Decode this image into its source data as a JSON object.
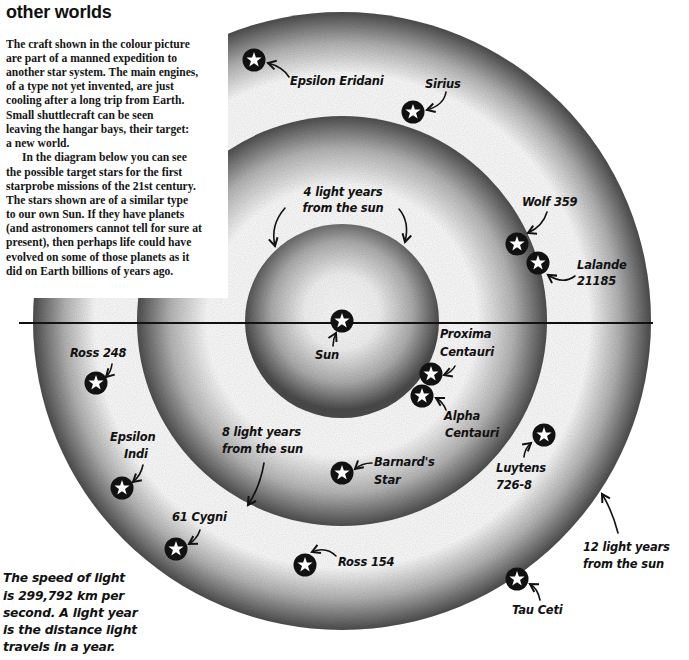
{
  "article": {
    "title": "other worlds",
    "intro_lines": [
      "The craft shown in the colour picture",
      "are part of a manned expedition to",
      "another star system. The main engines,",
      "of a type not yet invented, are just",
      "cooling after a long trip from Earth.",
      "Small shuttlecraft can be seen",
      "leaving the hangar bays, their target:",
      "a new world.",
      "In the diagram below you can see",
      "the possible target stars for the first",
      "starprobe missions of the 21st century.",
      "The stars shown are of a similar type",
      "to our own Sun. If they have planets",
      "(and astronomers cannot tell for sure at",
      "present), then perhaps life could have",
      "evolved on some of those planets as it",
      "did on Earth billions of years ago."
    ],
    "footnote_lines": [
      "The speed of light",
      "is 299,792 km per",
      "second. A light year",
      "is the distance light",
      "travels in a year."
    ]
  },
  "diagram": {
    "rings": [
      {
        "label_lines": [
          "4 light years",
          "from the sun"
        ]
      },
      {
        "label_lines": [
          "8 light years",
          "from the sun"
        ]
      },
      {
        "label_lines": [
          "12 light years",
          "from the sun"
        ]
      }
    ],
    "stars": [
      {
        "name_lines": [
          "Sun"
        ]
      },
      {
        "name_lines": [
          "Proxima",
          "Centauri"
        ]
      },
      {
        "name_lines": [
          "Alpha",
          "Centauri"
        ]
      },
      {
        "name_lines": [
          "Barnard's",
          "Star"
        ]
      },
      {
        "name_lines": [
          "Wolf 359"
        ]
      },
      {
        "name_lines": [
          "Lalande",
          "21185"
        ]
      },
      {
        "name_lines": [
          "Sirius"
        ]
      },
      {
        "name_lines": [
          "Epsilon Eridani"
        ]
      },
      {
        "name_lines": [
          "Ross 248"
        ]
      },
      {
        "name_lines": [
          "Epsilon",
          "Indi"
        ]
      },
      {
        "name_lines": [
          "61 Cygni"
        ]
      },
      {
        "name_lines": [
          "Ross 154"
        ]
      },
      {
        "name_lines": [
          "Luytens",
          "726-8"
        ]
      },
      {
        "name_lines": [
          "Tau Ceti"
        ]
      }
    ],
    "colors": {
      "ring_shade": "#4f4f4f",
      "star_disc": "#111111",
      "star_glyph": "#ffffff"
    }
  }
}
